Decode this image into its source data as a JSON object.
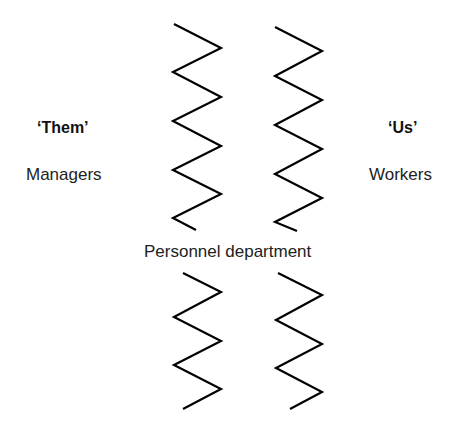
{
  "diagram": {
    "left_group": {
      "heading": "‘Them’",
      "label": "Managers"
    },
    "right_group": {
      "heading": "‘Us’",
      "label": "Workers"
    },
    "center_label": "Personnel department",
    "divider_style": "zigzag",
    "colors": {
      "line": "#000000",
      "text": "#222222",
      "background": "#ffffff"
    }
  }
}
